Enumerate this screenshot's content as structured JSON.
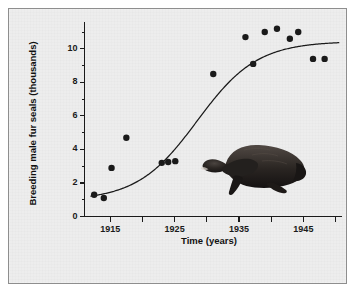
{
  "figure": {
    "background_color": "#ededed",
    "frame_color": "#8e8e8e",
    "ink_color": "#1a1a1a"
  },
  "axes": {
    "ylabel": "Breeding male fur seals (thousands)",
    "xlabel": "Time (years)",
    "ytick_labels": [
      "0",
      "2",
      "4",
      "6",
      "8",
      "10"
    ],
    "xtick_labels": [
      "1915",
      "1925",
      "1935",
      "1945"
    ]
  },
  "illustration": {
    "name": "fur-seal-illustration",
    "description": "dark silhouette of a fur seal facing left",
    "color": "#231f20"
  },
  "chart_data": {
    "type": "scatter",
    "title": "",
    "subtitle": "",
    "xlabel": "Time (years)",
    "ylabel": "Breeding male fur seals (thousands)",
    "xlim": [
      1911,
      1951
    ],
    "ylim": [
      0,
      11.6
    ],
    "xticks": [
      1915,
      1925,
      1935,
      1945
    ],
    "xticks_minor": [
      1920,
      1930,
      1940,
      1950
    ],
    "yticks": [
      0,
      2,
      4,
      6,
      8,
      10
    ],
    "yticks_minor": [
      1,
      3,
      5,
      7,
      9,
      11
    ],
    "grid": false,
    "legend": false,
    "legend_position": "none",
    "marker": "filled-circle",
    "marker_color": "#1a1a1a",
    "series": [
      {
        "name": "Breeding male fur seals (observed)",
        "type": "scatter",
        "points": [
          {
            "x": 1912.5,
            "y": 1.3
          },
          {
            "x": 1914.0,
            "y": 1.1
          },
          {
            "x": 1915.2,
            "y": 2.9
          },
          {
            "x": 1917.5,
            "y": 4.7
          },
          {
            "x": 1923.0,
            "y": 3.2
          },
          {
            "x": 1924.0,
            "y": 3.25
          },
          {
            "x": 1925.1,
            "y": 3.3
          },
          {
            "x": 1931.0,
            "y": 8.5
          },
          {
            "x": 1936.0,
            "y": 10.7
          },
          {
            "x": 1937.2,
            "y": 9.1
          },
          {
            "x": 1939.0,
            "y": 11.0
          },
          {
            "x": 1940.9,
            "y": 11.2
          },
          {
            "x": 1942.9,
            "y": 10.6
          },
          {
            "x": 1944.2,
            "y": 11.0
          },
          {
            "x": 1946.5,
            "y": 9.4
          },
          {
            "x": 1948.3,
            "y": 9.4
          }
        ]
      },
      {
        "name": "Fitted logistic growth curve",
        "type": "line",
        "line_color": "#1a1a1a",
        "asymptote": 10.45,
        "midpoint_year": 1928.5,
        "growth_rate": 0.215,
        "baseline": 0.95,
        "x_start": 1912.0,
        "x_end": 1950.5
      }
    ]
  }
}
